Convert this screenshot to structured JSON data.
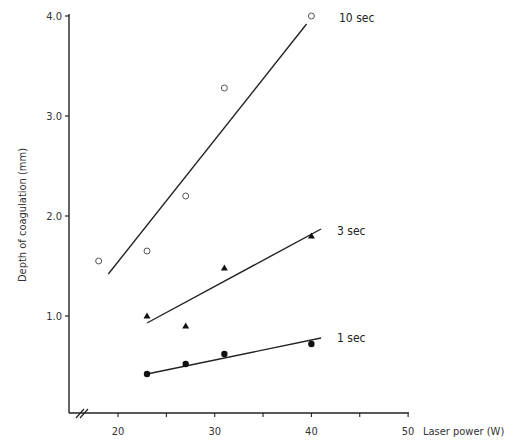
{
  "chart_data": {
    "type": "scatter",
    "title": "",
    "xlabel": "Laser power (W)",
    "ylabel": "Depth of coagulation (mm)",
    "xlim": [
      15,
      50
    ],
    "ylim": [
      0,
      4.0
    ],
    "x_ticks": [
      "20",
      "30",
      "40",
      "50"
    ],
    "y_ticks": [
      "1.0",
      "2.0",
      "3.0",
      "4.0"
    ],
    "grid": false,
    "legend": "inline labels at right end of each fit line",
    "axis_break": "x-axis broken near origin (//)",
    "series": [
      {
        "name": "10 sec",
        "marker": "open-circle",
        "points": [
          [
            18,
            1.55
          ],
          [
            23,
            1.65
          ],
          [
            27,
            2.2
          ],
          [
            31,
            3.28
          ],
          [
            40,
            4.0
          ]
        ],
        "fit_line": [
          [
            19,
            1.42
          ],
          [
            39.5,
            3.92
          ]
        ]
      },
      {
        "name": "3 sec",
        "marker": "filled-triangle",
        "points": [
          [
            23,
            1.0
          ],
          [
            27,
            0.9
          ],
          [
            31,
            1.48
          ],
          [
            40,
            1.8
          ]
        ],
        "fit_line": [
          [
            23,
            0.93
          ],
          [
            41,
            1.87
          ]
        ]
      },
      {
        "name": "1 sec",
        "marker": "filled-circle",
        "points": [
          [
            23,
            0.42
          ],
          [
            27,
            0.52
          ],
          [
            31,
            0.62
          ],
          [
            40,
            0.72
          ]
        ],
        "fit_line": [
          [
            23,
            0.42
          ],
          [
            41,
            0.78
          ]
        ]
      }
    ]
  }
}
